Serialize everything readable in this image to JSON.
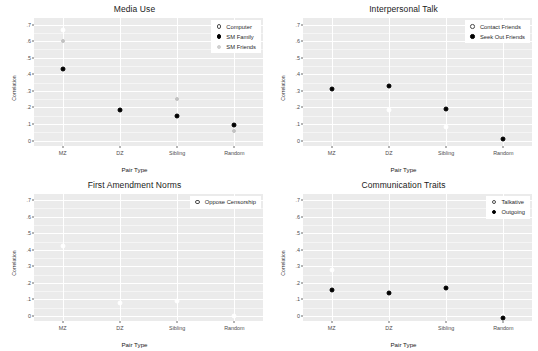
{
  "figure": {
    "background": "#ffffff",
    "panel_background": "#ebebeb",
    "gridline_color": "#ffffff",
    "marker_colors": {
      "filled": "#000000",
      "open": "#ffffff",
      "grey": "#c2c2c2"
    }
  },
  "axis": {
    "ylabel": "Correlation",
    "xlabel": "Pair Type",
    "ytick_labels": [
      ".7",
      ".6",
      ".5",
      ".4",
      ".3",
      ".2",
      ".1",
      "0"
    ],
    "ytick_values": [
      0.7,
      0.6,
      0.5,
      0.4,
      0.3,
      0.2,
      0.1,
      0.0
    ],
    "categories": [
      "MZ",
      "DZ",
      "Sibling",
      "Random"
    ],
    "ylim": [
      -0.03,
      0.74
    ]
  },
  "chart_data": [
    {
      "type": "scatter",
      "title": "Media Use",
      "xlabel": "Pair Type",
      "ylabel": "Correlation",
      "categories": [
        "MZ",
        "DZ",
        "Sibling",
        "Random"
      ],
      "ylim": [
        -0.03,
        0.74
      ],
      "grid": true,
      "legend_position": "top-right",
      "series": [
        {
          "name": "Computer",
          "marker": "open",
          "values": [
            0.67,
            null,
            null,
            null
          ]
        },
        {
          "name": "SM Family",
          "marker": "filled",
          "values": [
            0.43,
            0.185,
            0.15,
            0.095
          ]
        },
        {
          "name": "SM Friends",
          "marker": "grey",
          "values": [
            0.6,
            null,
            0.25,
            0.055
          ]
        }
      ]
    },
    {
      "type": "scatter",
      "title": "Interpersonal Talk",
      "xlabel": "Pair Type",
      "ylabel": "Correlation",
      "categories": [
        "MZ",
        "DZ",
        "Sibling",
        "Random"
      ],
      "ylim": [
        -0.03,
        0.74
      ],
      "grid": true,
      "legend_position": "top-right",
      "series": [
        {
          "name": "Contact Friends",
          "marker": "open",
          "values": [
            0.305,
            0.185,
            0.08,
            0.005
          ]
        },
        {
          "name": "Seek Out Friends",
          "marker": "filled",
          "values": [
            0.31,
            0.33,
            0.19,
            0.01
          ]
        }
      ]
    },
    {
      "type": "scatter",
      "title": "First Amendment Norms",
      "xlabel": "Pair Type",
      "ylabel": "Correlation",
      "categories": [
        "MZ",
        "DZ",
        "Sibling",
        "Random"
      ],
      "ylim": [
        -0.03,
        0.74
      ],
      "grid": true,
      "legend_position": "top-right",
      "series": [
        {
          "name": "Oppose Censorship",
          "marker": "open",
          "values": [
            0.42,
            0.08,
            0.09,
            0.0
          ]
        }
      ]
    },
    {
      "type": "scatter",
      "title": "Communication Traits",
      "xlabel": "Pair Type",
      "ylabel": "Correlation",
      "categories": [
        "MZ",
        "DZ",
        "Sibling",
        "Random"
      ],
      "ylim": [
        -0.03,
        0.74
      ],
      "grid": true,
      "legend_position": "top-right",
      "series": [
        {
          "name": "Talkative",
          "marker": "open",
          "values": [
            0.275,
            null,
            null,
            0.0
          ]
        },
        {
          "name": "Outgoing",
          "marker": "filled",
          "values": [
            0.16,
            0.14,
            0.17,
            -0.01
          ]
        }
      ]
    }
  ]
}
